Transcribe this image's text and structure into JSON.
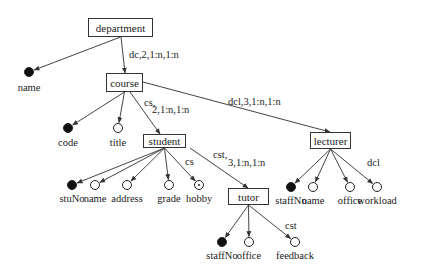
{
  "entities": [
    {
      "id": "department",
      "label": "department",
      "x": 88,
      "y": 18,
      "w": 65,
      "h": 19
    },
    {
      "id": "course",
      "label": "course",
      "x": 106,
      "y": 73,
      "w": 37,
      "h": 19
    },
    {
      "id": "student",
      "label": "student",
      "x": 143,
      "y": 134,
      "w": 43,
      "h": 14
    },
    {
      "id": "lecturer",
      "label": "lecturer",
      "x": 310,
      "y": 132,
      "w": 41,
      "h": 17
    },
    {
      "id": "tutor",
      "label": "tutor",
      "x": 228,
      "y": 188,
      "w": 41,
      "h": 17
    }
  ],
  "attributes": [
    {
      "id": "dept-name",
      "label": "name",
      "type": "key",
      "x": 29,
      "y": 72,
      "ly": 82,
      "from": "department"
    },
    {
      "id": "course-code",
      "label": "code",
      "type": "key",
      "x": 68,
      "y": 128,
      "ly": 137,
      "from": "course"
    },
    {
      "id": "course-title",
      "label": "title",
      "type": "plain",
      "x": 118,
      "y": 128,
      "ly": 137,
      "from": "course"
    },
    {
      "id": "student-stuNo",
      "label": "stuNo",
      "type": "key",
      "x": 72,
      "y": 185,
      "ly": 193,
      "from": "student"
    },
    {
      "id": "student-name",
      "label": "name",
      "type": "plain",
      "x": 95,
      "y": 185,
      "ly": 193,
      "from": "student"
    },
    {
      "id": "student-address",
      "label": "address",
      "type": "plain",
      "x": 127,
      "y": 185,
      "ly": 193,
      "from": "student"
    },
    {
      "id": "student-grade",
      "label": "grade",
      "type": "plain",
      "x": 169,
      "y": 185,
      "ly": 193,
      "from": "student"
    },
    {
      "id": "student-hobby",
      "label": "hobby",
      "type": "multi",
      "x": 199,
      "y": 185,
      "ly": 193,
      "from": "student"
    },
    {
      "id": "lecturer-staffNo",
      "label": "staffNo",
      "type": "key",
      "x": 291,
      "y": 187,
      "ly": 195,
      "from": "lecturer"
    },
    {
      "id": "lecturer-name",
      "label": "name",
      "type": "plain",
      "x": 313,
      "y": 187,
      "ly": 195,
      "from": "lecturer"
    },
    {
      "id": "lecturer-office",
      "label": "office",
      "type": "plain",
      "x": 350,
      "y": 187,
      "ly": 195,
      "from": "lecturer"
    },
    {
      "id": "lecturer-workload",
      "label": "workload",
      "type": "plain",
      "x": 377,
      "y": 187,
      "ly": 195,
      "from": "lecturer"
    },
    {
      "id": "tutor-staffNo",
      "label": "staffNo",
      "type": "key",
      "x": 222,
      "y": 242,
      "ly": 250,
      "from": "tutor"
    },
    {
      "id": "tutor-office",
      "label": "office",
      "type": "plain",
      "x": 249,
      "y": 242,
      "ly": 250,
      "from": "tutor"
    },
    {
      "id": "tutor-feedback",
      "label": "feedback",
      "type": "plain",
      "x": 295,
      "y": 242,
      "ly": 250,
      "from": "tutor"
    }
  ],
  "relationship_labels": [
    {
      "id": "dc",
      "text": "dc,2,1:n,1:n",
      "x": 129,
      "y": 49
    },
    {
      "id": "cs-1",
      "text": "cs,",
      "x": 144,
      "y": 97
    },
    {
      "id": "cs-2",
      "text": "2,1:n,1:n",
      "x": 152,
      "y": 104
    },
    {
      "id": "dcl",
      "text": "dcl,3,1:n,1:n",
      "x": 228,
      "y": 96
    },
    {
      "id": "cs-hobby",
      "text": "cs",
      "x": 185,
      "y": 156
    },
    {
      "id": "cst-1",
      "text": "cst,",
      "x": 213,
      "y": 149
    },
    {
      "id": "cst-2",
      "text": "3,1:n,1:n",
      "x": 228,
      "y": 157
    },
    {
      "id": "dcl-workload",
      "text": "dcl",
      "x": 367,
      "y": 157
    },
    {
      "id": "cst-feedback",
      "text": "cst",
      "x": 285,
      "y": 220
    }
  ],
  "edges": [
    {
      "from": [
        121,
        37
      ],
      "to": [
        125,
        73
      ]
    },
    {
      "from": [
        143,
        82
      ],
      "to": [
        330,
        132
      ]
    },
    {
      "from": [
        130,
        92
      ],
      "to": [
        160,
        134
      ]
    },
    {
      "from": [
        190,
        148
      ],
      "to": [
        248,
        188
      ]
    }
  ],
  "legend": {
    "key_attribute": "filled circle",
    "attribute": "hollow circle",
    "multi_valued": "circle with dot"
  }
}
